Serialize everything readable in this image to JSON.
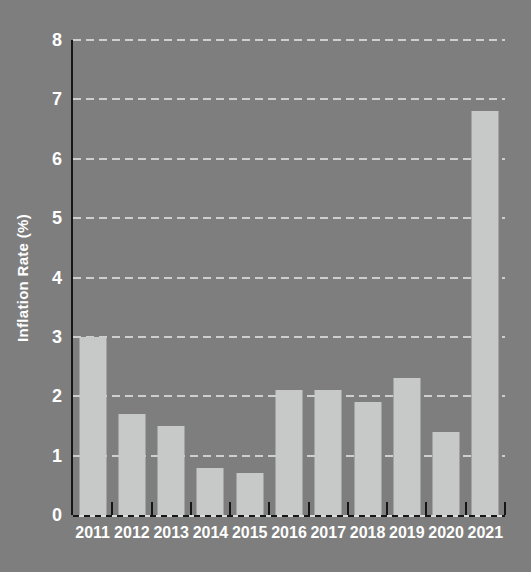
{
  "chart_data": {
    "type": "bar",
    "title": "",
    "xlabel": "",
    "ylabel": "Inflation Rate (%)",
    "categories": [
      "2011",
      "2012",
      "2013",
      "2014",
      "2015",
      "2016",
      "2017",
      "2018",
      "2019",
      "2020",
      "2021"
    ],
    "values": [
      3.0,
      1.7,
      1.5,
      0.8,
      0.7,
      2.1,
      2.1,
      1.9,
      2.3,
      1.4,
      6.8
    ],
    "ylim": [
      0,
      8
    ],
    "yticks": [
      0,
      1,
      2,
      3,
      4,
      5,
      6,
      7,
      8
    ],
    "grid": true,
    "grid_style": "dashed",
    "legend_position": "none",
    "colors": {
      "background": "#7d7e7d",
      "bar": "#c6c9c8",
      "grid": "#dcdedd",
      "axis": "#161616",
      "text": "#ffffff"
    }
  }
}
